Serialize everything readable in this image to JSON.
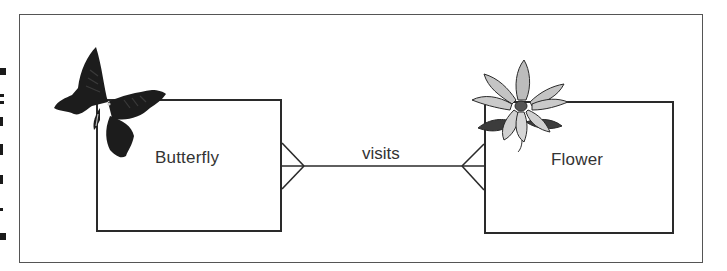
{
  "diagram": {
    "type": "entity-relationship",
    "entities": [
      {
        "id": "butterfly",
        "label": "Butterfly",
        "icon": "butterfly-icon"
      },
      {
        "id": "flower",
        "label": "Flower",
        "icon": "flower-icon"
      }
    ],
    "relationship": {
      "label": "visits",
      "from": "butterfly",
      "to": "flower",
      "from_cardinality": "many",
      "to_cardinality": "many"
    }
  },
  "colors": {
    "line": "#2a2a2a",
    "frame": "#555555",
    "background": "#ffffff"
  }
}
